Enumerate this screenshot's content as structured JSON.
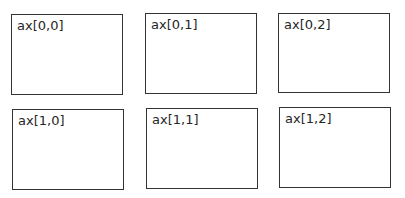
{
  "figure": {
    "background": "#ffffff",
    "line_color": "#333333",
    "text_color": "#262626",
    "grid": {
      "rows": 2,
      "cols": 3
    },
    "axes": [
      {
        "label": "ax[0,0]",
        "row": 0,
        "col": 0
      },
      {
        "label": "ax[0,1]",
        "row": 0,
        "col": 1
      },
      {
        "label": "ax[0,2]",
        "row": 0,
        "col": 2
      },
      {
        "label": "ax[1,0]",
        "row": 1,
        "col": 0
      },
      {
        "label": "ax[1,1]",
        "row": 1,
        "col": 1
      },
      {
        "label": "ax[1,2]",
        "row": 1,
        "col": 2
      }
    ]
  }
}
